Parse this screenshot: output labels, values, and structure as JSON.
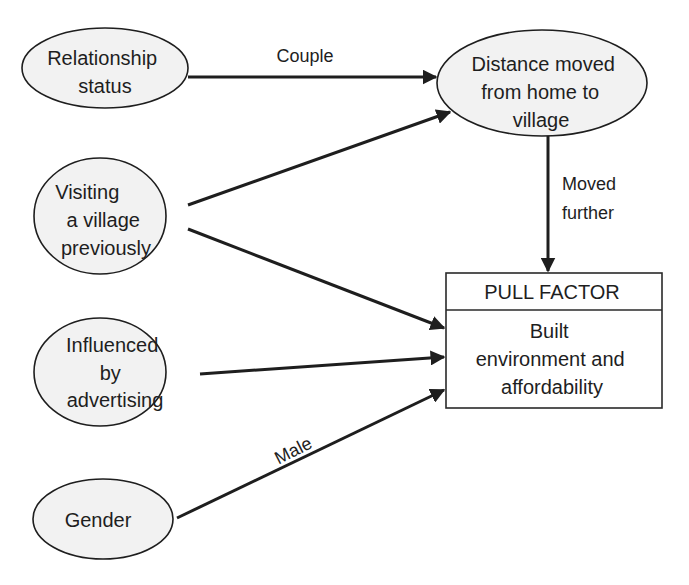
{
  "diagram": {
    "nodes": {
      "relationship_status": {
        "lines": [
          "Relationship",
          "status"
        ],
        "shape": "ellipse"
      },
      "visiting_village": {
        "lines": [
          "Visiting",
          "a village",
          "previously"
        ],
        "shape": "ellipse"
      },
      "influenced_advertising": {
        "lines": [
          "Influenced",
          "by",
          "advertising"
        ],
        "shape": "ellipse"
      },
      "gender": {
        "lines": [
          "Gender"
        ],
        "shape": "ellipse"
      },
      "distance_moved": {
        "lines": [
          "Distance moved",
          "from home to",
          "village"
        ],
        "shape": "ellipse"
      },
      "pull_factor": {
        "header": "PULL FACTOR",
        "lines": [
          "Built",
          "environment and",
          "affordability"
        ],
        "shape": "box"
      }
    },
    "edges": [
      {
        "from": "relationship_status",
        "to": "distance_moved",
        "label": "Couple"
      },
      {
        "from": "visiting_village",
        "to": "distance_moved",
        "label": ""
      },
      {
        "from": "visiting_village",
        "to": "pull_factor",
        "label": ""
      },
      {
        "from": "influenced_advertising",
        "to": "pull_factor",
        "label": ""
      },
      {
        "from": "gender",
        "to": "pull_factor",
        "label": "Male"
      },
      {
        "from": "distance_moved",
        "to": "pull_factor",
        "label_lines": [
          "Moved",
          "further"
        ]
      }
    ],
    "colors": {
      "ellipse_fill": "#f2f2f2",
      "stroke": "#1e1e1e",
      "background": "#ffffff"
    }
  }
}
